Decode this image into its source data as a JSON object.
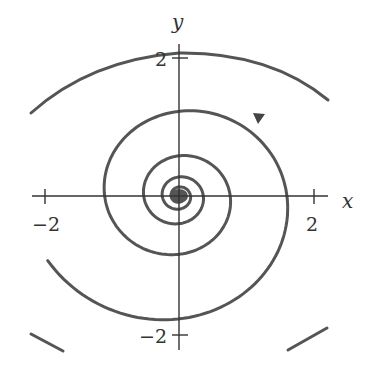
{
  "figure": {
    "type": "phase-portrait",
    "axes": {
      "x_label": "x",
      "y_label": "y",
      "x_ticks": [
        {
          "value": -2,
          "label": "−2"
        },
        {
          "value": 2,
          "label": "2"
        }
      ],
      "y_ticks": [
        {
          "value": 2,
          "label": "2"
        },
        {
          "value": -2,
          "label": "−2"
        }
      ]
    },
    "trajectory": {
      "direction": "counterclockwise, spiraling inward",
      "arrow": "arrowhead on second ring in upper-right quadrant pointing up-left"
    },
    "colors": {
      "curve": "#555555",
      "axis": "#333333",
      "background": "#ffffff"
    }
  }
}
